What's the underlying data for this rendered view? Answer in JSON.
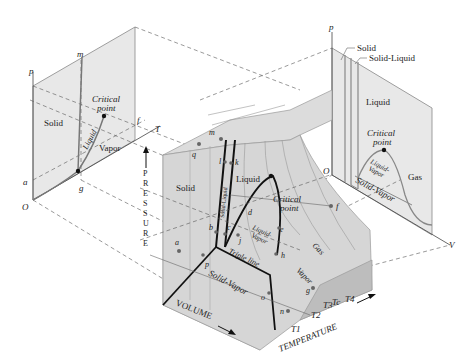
{
  "diagram": {
    "type": "p-v-T surface (substance that expands on freezing)",
    "left_projection": {
      "title": "p-T phase diagram",
      "axis_p": "p",
      "axis_T": "T",
      "origin": "O",
      "regions": [
        "Solid",
        "Liquid",
        "Vapor"
      ],
      "critical_point_label": [
        "Critical",
        "point"
      ],
      "points": [
        "m",
        "f",
        "a",
        "g"
      ]
    },
    "right_projection": {
      "title": "p-v diagram",
      "axis_p": "p",
      "axis_V": "V",
      "origin": "O",
      "callouts": [
        "Solid",
        "Solid-Liquid"
      ],
      "regions": [
        "Liquid",
        "Gas",
        "Solid-Vapor"
      ],
      "liquid_vapor": [
        "Liquid-",
        "Vapor"
      ],
      "critical_point_label": [
        "Critical",
        "point"
      ]
    },
    "surface": {
      "axis_pressure": "PRESSURE",
      "axis_volume": "VOLUME",
      "axis_temperature": "TEMPERATURE",
      "regions": {
        "solid": "Solid",
        "liquid": "Liquid",
        "gas": "Gas",
        "vapor": "Vapor",
        "solid_liquid": "Solid-Liquid",
        "liquid_vapor": [
          "Liquid-",
          "Vapor"
        ],
        "solid_vapor": "Solid-Vapor",
        "triple_line": "Triple line",
        "critical_point": [
          "Critical",
          "point"
        ]
      },
      "points": [
        "m",
        "q",
        "l",
        "k",
        "a",
        "b",
        "c",
        "d",
        "e",
        "j",
        "h",
        "p",
        "o",
        "n",
        "g",
        "f",
        "O"
      ],
      "isotherms": [
        "T1",
        "T2",
        "T3",
        "Tc",
        "T4"
      ]
    }
  }
}
